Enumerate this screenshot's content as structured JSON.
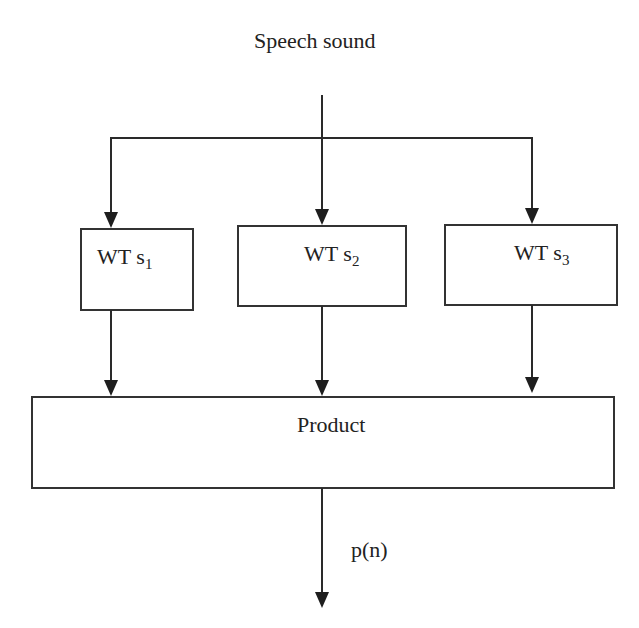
{
  "diagram": {
    "input_label": "Speech sound",
    "blocks": [
      {
        "prefix": "WT s",
        "subscript": "1"
      },
      {
        "prefix": "WT s",
        "subscript": "2"
      },
      {
        "prefix": "WT s",
        "subscript": "3"
      }
    ],
    "combiner_label": "Product",
    "output_label": "p(n)",
    "colors": {
      "stroke": "#2a2a2a",
      "background": "#ffffff",
      "text": "#222222"
    }
  }
}
